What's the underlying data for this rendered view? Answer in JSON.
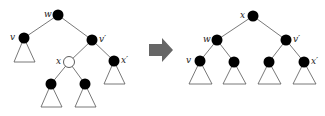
{
  "diagram": {
    "colors": {
      "node_black": "#000000",
      "node_white": "#ffffff",
      "edge": "#555555",
      "arrow": "#666666"
    },
    "left_tree": {
      "labels": {
        "w": "w",
        "v": "v",
        "vp": "v′",
        "x": "x",
        "xp": "x′"
      }
    },
    "arrow": {
      "direction": "right"
    },
    "right_tree": {
      "labels": {
        "x": "x",
        "w": "w",
        "vp": "v′",
        "v": "v",
        "xp": "x′"
      }
    }
  }
}
